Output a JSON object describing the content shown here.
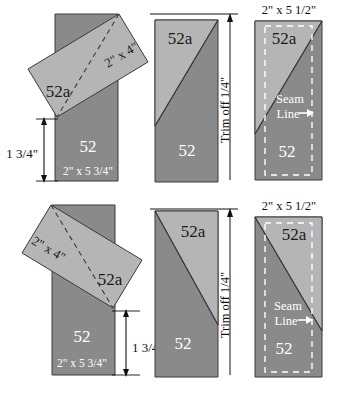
{
  "diagram": {
    "colors": {
      "dark_fabric": "#8a8a8a",
      "light_fabric": "#b5b5b5",
      "outline": "#3a3a3a",
      "dark_label_text": "#ffffff",
      "light_label_text": "#1a1a1a",
      "seam_dash": "#ffffff",
      "dimension_line": "#1a1a1a",
      "background": "#ffffff"
    },
    "piece_labels": {
      "base": "52",
      "accent": "52a"
    },
    "rows": [
      {
        "row_name": "right-leaning-version",
        "steps": [
          {
            "step_name": "place-accent-strip",
            "base_size": "2\" x 5 3/4\"",
            "accent_size": "2\" x 4\"",
            "offset_dimension": "1 3/4\"",
            "offset_side": "left",
            "base_label": "52",
            "accent_label": "52a"
          },
          {
            "step_name": "trim-excess",
            "trim_note": "Trim off 1/4\"",
            "base_label": "52",
            "accent_label": "52a"
          },
          {
            "step_name": "finished-unit",
            "finished_size": "2\" x 5 1/2\"",
            "seam_note_line1": "Seam",
            "seam_note_line2": "Line",
            "base_label": "52",
            "accent_label": "52a"
          }
        ]
      },
      {
        "row_name": "left-leaning-version",
        "steps": [
          {
            "step_name": "place-accent-strip",
            "base_size": "2\" x 5 3/4\"",
            "accent_size": "2\" x 4\"",
            "offset_dimension": "1 3/4\"",
            "offset_side": "right",
            "base_label": "52",
            "accent_label": "52a"
          },
          {
            "step_name": "trim-excess",
            "trim_note": "Trim off 1/4\"",
            "base_label": "52",
            "accent_label": "52a"
          },
          {
            "step_name": "finished-unit",
            "finished_size": "2\" x 5 1/2\"",
            "seam_note_line1": "Seam",
            "seam_note_line2": "Line",
            "base_label": "52",
            "accent_label": "52a"
          }
        ]
      }
    ]
  }
}
